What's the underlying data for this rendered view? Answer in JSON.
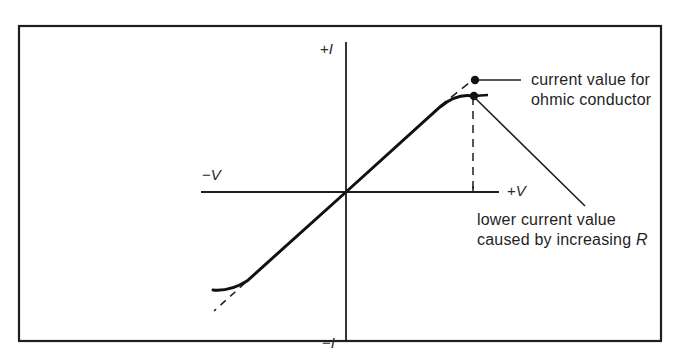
{
  "diagram": {
    "title": "",
    "axes": {
      "x_positive_label": "+V",
      "x_negative_label": "−V",
      "y_positive_label": "+I",
      "y_negative_label": "−I",
      "x_sign_pos": "+",
      "x_sign_neg": "−",
      "y_sign_pos": "+",
      "y_sign_neg": "−",
      "x_symbol": "V",
      "y_symbol": "I"
    },
    "annotations": {
      "ohmic": {
        "line1": "current value for",
        "line2": "ohmic conductor"
      },
      "lower": {
        "line1": "lower current value",
        "line2_prefix": "caused by increasing ",
        "line2_symbol": "R"
      }
    },
    "curves": {
      "actual": "solid curve, linear through origin, bending below the line at both extremes",
      "ohmic": "dashed straight line extending the linear region"
    },
    "colors": {
      "stroke": "#1a1a1a",
      "background": "#ffffff"
    }
  }
}
